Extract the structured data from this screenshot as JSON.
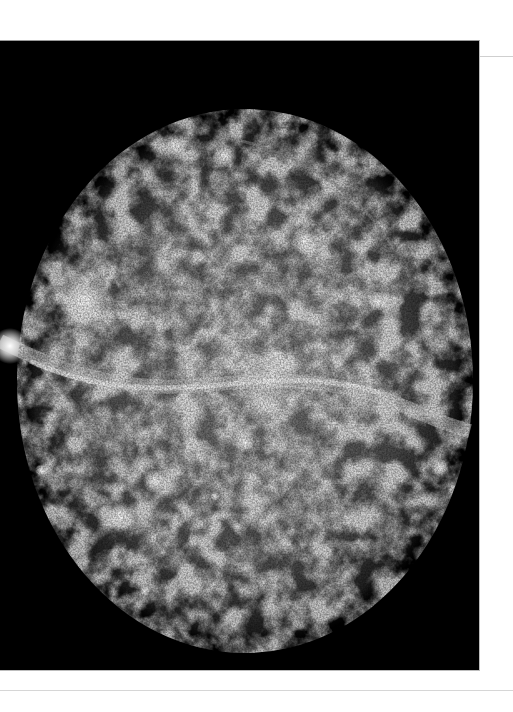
{
  "image": {
    "subject": "grayscale nebula / supernova remnant",
    "background_color": "#000000",
    "page_color": "#ffffff",
    "panel": {
      "x": 0,
      "y": 40,
      "width": 480,
      "height": 631
    },
    "nebula": {
      "cx": 245,
      "cy": 340,
      "rx": 225,
      "ry": 270
    },
    "bright_knots": [
      {
        "x": 85,
        "y": 260,
        "r": 30
      },
      {
        "x": 10,
        "y": 305,
        "r": 18
      },
      {
        "x": 270,
        "y": 340,
        "r": 35
      },
      {
        "x": 305,
        "y": 200,
        "r": 14
      },
      {
        "x": 175,
        "y": 105,
        "r": 14
      },
      {
        "x": 225,
        "y": 115,
        "r": 12
      },
      {
        "x": 245,
        "y": 402,
        "r": 10
      },
      {
        "x": 155,
        "y": 440,
        "r": 12
      },
      {
        "x": 120,
        "y": 475,
        "r": 14
      },
      {
        "x": 440,
        "y": 427,
        "r": 9
      },
      {
        "x": 145,
        "y": 550,
        "r": 5
      },
      {
        "x": 378,
        "y": 260,
        "r": 10
      },
      {
        "x": 360,
        "y": 360,
        "r": 22
      }
    ]
  },
  "rules": {
    "top_right": {
      "y": 56,
      "color": "#cfcfcf"
    },
    "bottom": {
      "y": 690,
      "color": "#d6d6d6"
    }
  }
}
